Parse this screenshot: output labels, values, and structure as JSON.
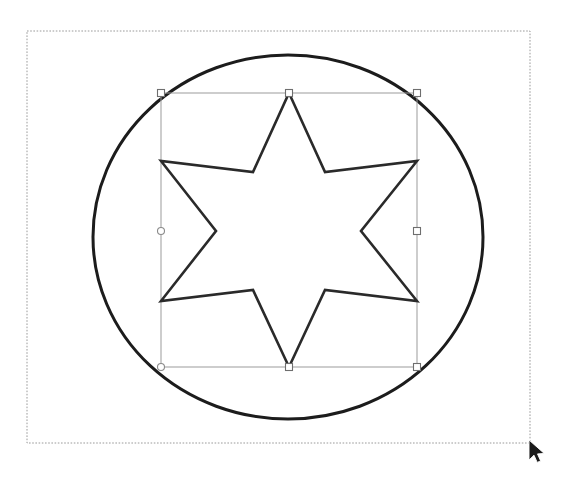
{
  "app": {
    "title": "Vector Drawing Canvas",
    "background_color": "#ffffff"
  },
  "canvas": {
    "name": "drawing-canvas",
    "border_style": "dotted",
    "border_color": "#9a9a9a",
    "x": 27,
    "y": 31,
    "width": 503,
    "height": 412
  },
  "shapes": {
    "circle": {
      "label": "circle",
      "cx": 288,
      "cy": 237,
      "rx": 195,
      "ry": 182,
      "stroke_color": "#1c1c1c",
      "stroke_width": 3,
      "fill": "none"
    },
    "star": {
      "label": "six-pointed-star",
      "points": 6,
      "cx": 289,
      "cy": 230,
      "outer_radius": 137,
      "inner_radius": 73,
      "rotation_deg": -90,
      "stroke_color": "#2a2a2a",
      "stroke_width": 2.6,
      "fill": "none",
      "path": "M 289,93 L 325,172 L 417,161 L 361,231 L 417,301 L 325,290 L 289,367 L 253,290 L 161,301 L 216,231 L 161,161 L 253,172 Z"
    }
  },
  "selection": {
    "label": "selection-bounding-box",
    "x": 161,
    "y": 93,
    "width": 256,
    "height": 274,
    "outline_color": "#9b9b9b",
    "handle_fill": "#ffffff",
    "handle_stroke": "#6e6e6e",
    "handle_size": 7,
    "handles": [
      {
        "name": "handle-top-left",
        "shape": "square",
        "x": 161,
        "y": 93
      },
      {
        "name": "handle-top-center",
        "shape": "square",
        "x": 289,
        "y": 93
      },
      {
        "name": "handle-top-right",
        "shape": "square",
        "x": 417,
        "y": 93
      },
      {
        "name": "handle-middle-left",
        "shape": "circle",
        "x": 161,
        "y": 231
      },
      {
        "name": "handle-middle-right",
        "shape": "square",
        "x": 417,
        "y": 231
      },
      {
        "name": "handle-bottom-left",
        "shape": "circle",
        "x": 161,
        "y": 367
      },
      {
        "name": "handle-bottom-center",
        "shape": "square",
        "x": 289,
        "y": 367
      },
      {
        "name": "handle-bottom-right",
        "shape": "square",
        "x": 417,
        "y": 367
      }
    ]
  },
  "cursor": {
    "label": "mouse-pointer",
    "type": "arrow",
    "x": 529,
    "y": 440,
    "fill": "#1a1a1a",
    "stroke": "#ffffff"
  }
}
